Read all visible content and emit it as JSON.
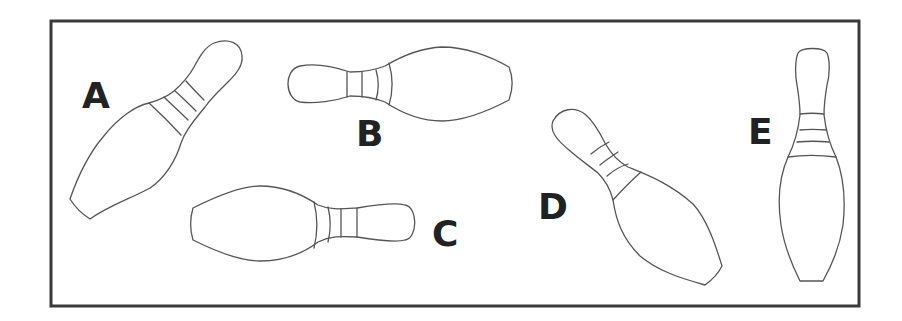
{
  "figure": {
    "frame": {
      "border_color": "#3a3a3a",
      "background": "#ffffff"
    },
    "pins": [
      {
        "id": "A",
        "label": "A",
        "orientation": "tilted, head up-right, base down-left"
      },
      {
        "id": "B",
        "label": "B",
        "orientation": "horizontal, head left, base right"
      },
      {
        "id": "C",
        "label": "C",
        "orientation": "horizontal, base left, head right"
      },
      {
        "id": "D",
        "label": "D",
        "orientation": "tilted, head up-left, base down-right"
      },
      {
        "id": "E",
        "label": "E",
        "orientation": "upright, head up, base down"
      }
    ],
    "stroke_color": "#555555",
    "label_color": "#222222"
  }
}
